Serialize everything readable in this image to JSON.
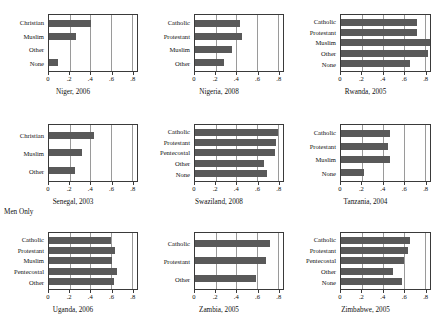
{
  "chart_data": {
    "type": "bar",
    "orientation": "horizontal",
    "title": "",
    "xlabel": "",
    "ylabel": "",
    "xlim": [
      0,
      0.85
    ],
    "grid": true,
    "legend": null,
    "tick_values": [
      0,
      0.2,
      0.4,
      0.6,
      0.8
    ],
    "tick_labels": [
      "0",
      ".2",
      ".4",
      ".6",
      ".8"
    ],
    "bar_color": "#595959",
    "panels": [
      {
        "title": "Niger, 2006",
        "note": "",
        "categories": [
          "Christian",
          "Muslim",
          "Other",
          "None"
        ],
        "values": [
          0.41,
          0.26,
          0.0,
          0.09
        ]
      },
      {
        "title": "Nigeria, 2008",
        "note": "",
        "categories": [
          "Catholic",
          "Protestant",
          "Muslim",
          "Other"
        ],
        "values": [
          0.43,
          0.45,
          0.36,
          0.28
        ]
      },
      {
        "title": "Rwanda, 2005",
        "note": "",
        "categories": [
          "Catholic",
          "Protestant",
          "Muslim",
          "Other",
          "None"
        ],
        "values": [
          0.73,
          0.73,
          0.86,
          0.83,
          0.66
        ]
      },
      {
        "title": "Senegal, 2003",
        "note": "Men Only",
        "categories": [
          "Christian",
          "Muslim",
          "Other"
        ],
        "values": [
          0.43,
          0.32,
          0.25
        ]
      },
      {
        "title": "Swaziland, 2008",
        "note": "",
        "categories": [
          "Catholic",
          "Protestant",
          "Pentecostal",
          "Other",
          "None"
        ],
        "values": [
          0.8,
          0.78,
          0.77,
          0.67,
          0.7
        ]
      },
      {
        "title": "Tanzania, 2004",
        "note": "",
        "categories": [
          "Catholic",
          "Protestant",
          "Muslim",
          "None"
        ],
        "values": [
          0.47,
          0.45,
          0.47,
          0.22
        ]
      },
      {
        "title": "Uganda, 2006",
        "note": "",
        "categories": [
          "Catholic",
          "Protestant",
          "Muslim",
          "Pentecostal",
          "Other"
        ],
        "values": [
          0.6,
          0.64,
          0.61,
          0.66,
          0.63
        ]
      },
      {
        "title": "Zambia, 2005",
        "note": "",
        "categories": [
          "Catholic",
          "Protestant",
          "Other"
        ],
        "values": [
          0.72,
          0.69,
          0.59
        ]
      },
      {
        "title": "Zimbabwe, 2005",
        "note": "",
        "categories": [
          "Catholic",
          "Protestant",
          "Pentecostal",
          "Other",
          "None"
        ],
        "values": [
          0.66,
          0.64,
          0.6,
          0.5,
          0.58
        ]
      }
    ]
  }
}
